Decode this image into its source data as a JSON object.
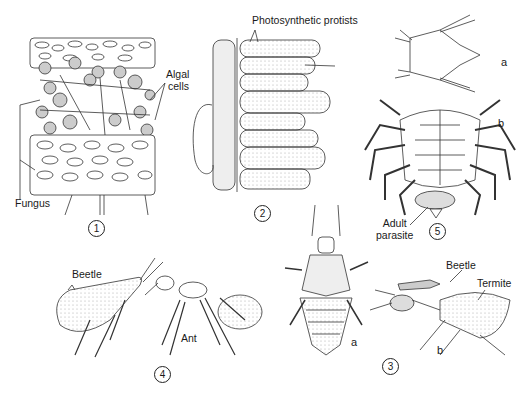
{
  "figure": {
    "panels": [
      {
        "number": "1",
        "subject": "Lichen cross-section",
        "labels": [
          "Algal cells",
          "Fungus"
        ]
      },
      {
        "number": "2",
        "subject": "Host cells with photosynthetic protists",
        "labels": [
          "Photosynthetic protists"
        ]
      },
      {
        "number": "3",
        "subject": "Termitophilous beetles",
        "sublabels": [
          "a",
          "b"
        ],
        "labels": [
          "Beetle",
          "Termite"
        ]
      },
      {
        "number": "4",
        "subject": "Beetle and ant",
        "labels": [
          "Beetle",
          "Ant"
        ]
      },
      {
        "number": "5",
        "subject": "Parasitic barnacle on crab",
        "sublabels": [
          "a",
          "b"
        ],
        "labels": [
          "Adult parasite"
        ]
      }
    ]
  },
  "labels": {
    "algal_cells_line1": "Algal",
    "algal_cells_line2": "cells",
    "fungus": "Fungus",
    "photosynthetic_protists": "Photosynthetic protists",
    "adult_parasite_line1": "Adult",
    "adult_parasite_line2": "parasite",
    "beetle_4": "Beetle",
    "ant": "Ant",
    "beetle_3": "Beetle",
    "termite": "Termite",
    "sub_a_5": "a",
    "sub_b_5": "b",
    "sub_a_3": "a",
    "sub_b_3": "b"
  },
  "numbers": {
    "n1": "1",
    "n2": "2",
    "n3": "3",
    "n4": "4",
    "n5": "5"
  }
}
